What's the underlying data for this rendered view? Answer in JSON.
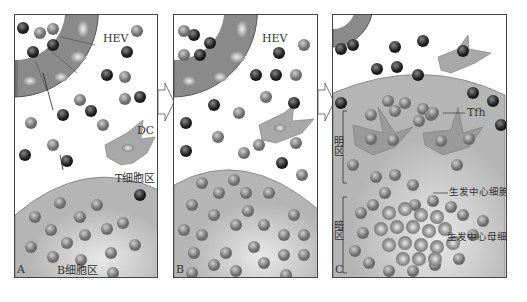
{
  "figure": {
    "panels": [
      {
        "id": "A",
        "letter": "A",
        "hev_label": "HEV",
        "dc_label": "DC",
        "t_zone_label": "T细胞区",
        "b_zone_label": "B细胞区"
      },
      {
        "id": "B",
        "letter": "B",
        "hev_label": "HEV"
      },
      {
        "id": "C",
        "letter": "C",
        "tfh_label": "Tfh",
        "light_zone_label": "明\n区",
        "dark_zone_label": "暗\n区",
        "gc_cell_label": "生发中心细胞",
        "gc_blast_label": "生发中心母细胞"
      }
    ],
    "cell_letters": {
      "t": "T",
      "b": "B"
    },
    "colors": {
      "hev_ring": "#8a8a8a",
      "follicle": "#c9c9c9",
      "t_cell": "#3a3a3a",
      "b_cell": "#8c8c8c",
      "dc": "#a8a8a8",
      "outline": "#444444"
    }
  }
}
